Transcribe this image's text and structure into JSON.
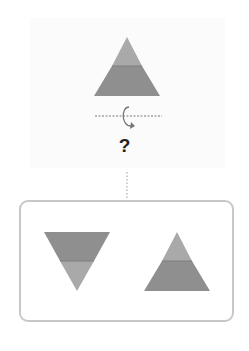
{
  "question": {
    "mark": "?"
  },
  "colors": {
    "light_gray": "#a9a9a9",
    "dark_gray": "#8f8f8f",
    "border": "#c8c8c8",
    "dashed_line": "#777777"
  },
  "figure": {
    "original": "triangle-two-band-light-top-dark-bottom",
    "rotation_axis": "horizontal-dashed-line",
    "rotation_icon": "circular-arrow-icon"
  },
  "options": [
    {
      "shape": "inverted-triangle-dark-top-light-bottom"
    },
    {
      "shape": "triangle-light-top-dark-bottom"
    }
  ]
}
